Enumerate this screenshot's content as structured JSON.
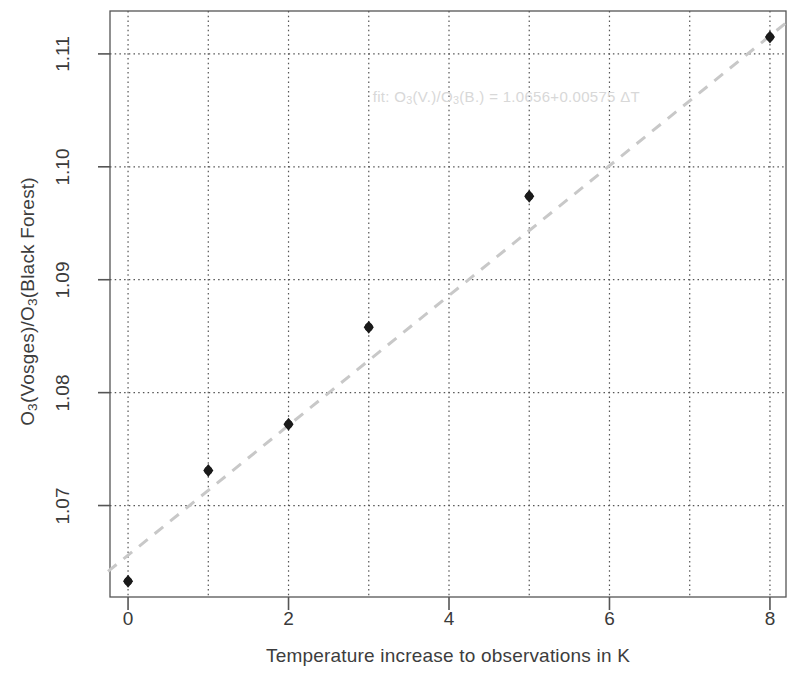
{
  "chart_data": {
    "type": "scatter",
    "title": "",
    "xlabel": "Temperature increase to observations in K",
    "ylabel": "O3(Vosges)/O3(Black Forest)",
    "ylabel_parts": {
      "p1": "O",
      "sub1": "3",
      "p2": "(Vosges)/O",
      "sub2": "3",
      "p3": "(Black Forest)"
    },
    "x": [
      0,
      1,
      2,
      3,
      5,
      8
    ],
    "values": [
      1.0633,
      1.0731,
      1.0772,
      1.0858,
      1.0974,
      1.1115
    ],
    "series": [
      {
        "name": "model ratio",
        "x": [
          0,
          1,
          2,
          3,
          5,
          8
        ],
        "values": [
          1.0633,
          1.0731,
          1.0772,
          1.0858,
          1.0974,
          1.1115
        ],
        "marker": "filled-diamond",
        "color": "#1a1a1a"
      },
      {
        "name": "fit",
        "type": "line",
        "style": "dashed",
        "color": "#c8c8c8",
        "intercept": 1.0656,
        "slope": 0.00575,
        "x_endpoints": [
          -0.25,
          8.2
        ]
      }
    ],
    "xlim": [
      -0.225,
      8.2
    ],
    "ylim": [
      1.0619,
      1.1138
    ],
    "xticks": [
      0,
      2,
      4,
      6,
      8
    ],
    "xtick_labels": [
      "0",
      "2",
      "4",
      "6",
      "8"
    ],
    "xgrid_at": [
      0,
      1,
      2,
      3,
      4,
      5,
      6,
      7,
      8
    ],
    "yticks": [
      1.07,
      1.08,
      1.09,
      1.1,
      1.11
    ],
    "ytick_labels": [
      "1.07",
      "1.08",
      "1.09",
      "1.10",
      "1.11"
    ],
    "grid": true,
    "grid_style": "dotted",
    "grid_color": "#555555",
    "legend": "none",
    "annotations": [
      {
        "text": "fit: O3(V.)/O3(B.) = 1.0656+0.00575 ΔT",
        "parts": {
          "a": "fit: O",
          "s1": "3",
          "b": "(V.)/O",
          "s2": "3",
          "c": "(B.) = 1.0656+0.00575 ΔT"
        },
        "x": 3.05,
        "y": 1.1062,
        "color": "#d8d8d8"
      }
    ]
  },
  "axes": {
    "frame_color": "#555555",
    "background": "#ffffff"
  }
}
